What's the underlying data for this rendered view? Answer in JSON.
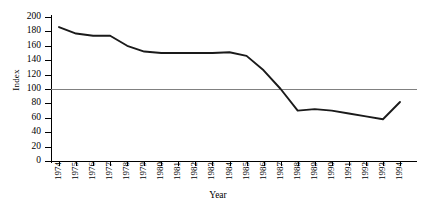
{
  "chart_data": {
    "type": "line",
    "title": "",
    "xlabel": "Year",
    "ylabel": "Index",
    "categories": [
      "1974",
      "1975",
      "1976",
      "1977",
      "1978",
      "1979",
      "1980",
      "1981",
      "1982",
      "1983",
      "1984",
      "1985",
      "1986",
      "1987",
      "1988",
      "1989",
      "1990",
      "1991",
      "1992",
      "1993",
      "1994"
    ],
    "values": [
      186,
      177,
      174,
      174,
      160,
      152,
      150,
      150,
      150,
      150,
      151,
      146,
      126,
      100,
      70,
      72,
      70,
      66,
      62,
      58,
      82
    ],
    "series": [
      {
        "name": "Index",
        "values": [
          186,
          177,
          174,
          174,
          160,
          152,
          150,
          150,
          150,
          150,
          151,
          146,
          126,
          100,
          70,
          72,
          70,
          66,
          62,
          58,
          82
        ]
      }
    ],
    "ylim": [
      0,
      200
    ],
    "yticks": [
      0,
      20,
      40,
      60,
      80,
      100,
      120,
      140,
      160,
      180,
      200
    ],
    "ytick_labels": [
      "0",
      "20",
      "40",
      "60",
      "80",
      "100",
      "120",
      "140",
      "160",
      "180",
      "200"
    ],
    "reference_line": {
      "value": 100,
      "orientation": "horizontal",
      "color": "#808080"
    },
    "grid": false,
    "legend": null,
    "line_color": "#1a1a1a"
  }
}
